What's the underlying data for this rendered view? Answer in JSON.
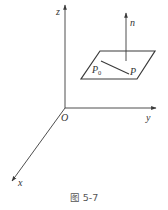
{
  "figure": {
    "caption": "图 5-7",
    "colors": {
      "stroke": "#3a3a3a",
      "text": "#333333",
      "caption": "#555555"
    },
    "axes": {
      "origin_label": "O",
      "x_label": "x",
      "y_label": "y",
      "z_label": "z"
    },
    "normal_vector": {
      "label": "n"
    },
    "plane": {
      "points": {
        "p0_label": "P",
        "p0_subscript": "0",
        "p_label": "P"
      }
    }
  }
}
